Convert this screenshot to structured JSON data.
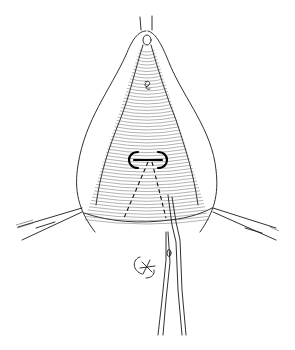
{
  "illustration": {
    "subject": "surgical line drawing",
    "elements": [
      "tissue-outline",
      "retraction-clamp-left",
      "retraction-clamp-right",
      "scissors",
      "incision-guide-dashed",
      "suture-mark",
      "knot-symbol"
    ]
  },
  "colors": {
    "background": "#ffffff",
    "ink": "#1a1a1a"
  }
}
